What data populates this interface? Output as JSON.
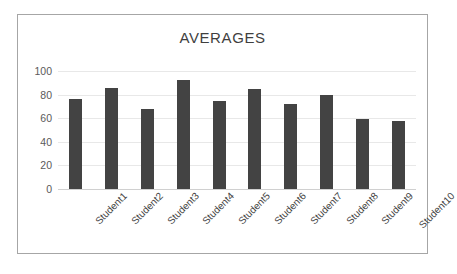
{
  "chart_data": {
    "type": "bar",
    "title": "AVERAGES",
    "xlabel": "",
    "ylabel": "",
    "categories": [
      "Student1",
      "Student2",
      "Student3",
      "Student4",
      "Student5",
      "Student6",
      "Student7",
      "Student8",
      "Student9",
      "Student10"
    ],
    "values": [
      76,
      86,
      68,
      92,
      75,
      85,
      72,
      80,
      59,
      57.5
    ],
    "ylim": [
      0,
      100
    ],
    "yticks": [
      0,
      20,
      40,
      60,
      80,
      100
    ],
    "ytick_labels": [
      "0",
      "20",
      "40",
      "60",
      "80",
      "100"
    ],
    "grid": true,
    "legend": false,
    "series": [
      {
        "name": "Averages",
        "values": [
          76,
          86,
          68,
          92,
          75,
          85,
          72,
          80,
          59,
          57.5
        ]
      }
    ],
    "colors": {
      "bar": "#434343",
      "gridline": "#e8e8e8",
      "axis": "#d0d0d0",
      "frame_border": "#a6a6a6",
      "title_text": "#3f3f3f",
      "tick_text": "#5a5a5a",
      "background": "#ffffff"
    }
  }
}
